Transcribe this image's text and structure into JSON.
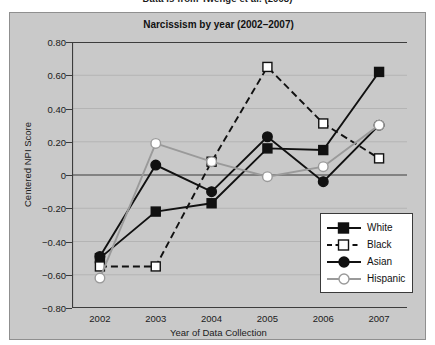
{
  "figure": {
    "caption": "Data is from Twenge et al. (2008)"
  },
  "chart_data": {
    "type": "line",
    "title": "Narcissism by year (2002–2007)",
    "xlabel": "Year of Data Collection",
    "ylabel": "Centered NPI Score",
    "x": [
      2002,
      2003,
      2004,
      2005,
      2006,
      2007
    ],
    "xtick_labels": [
      "2002",
      "2003",
      "2004",
      "2005",
      "2006",
      "2007"
    ],
    "ytick_labels": [
      "0.80",
      "0.60",
      "0.40",
      "0.20",
      "0",
      "−0.20",
      "−0.40",
      "−0.60",
      "−0.80"
    ],
    "ytick_values": [
      0.8,
      0.6,
      0.4,
      0.2,
      0,
      -0.2,
      -0.4,
      -0.6,
      -0.8
    ],
    "ylim": [
      -0.8,
      0.8
    ],
    "grid": true,
    "legend_position": "lower-right",
    "background_color": "#c9c9c9",
    "series": [
      {
        "name": "White",
        "values": [
          -0.5,
          -0.22,
          -0.17,
          0.16,
          0.15,
          0.62
        ],
        "marker": "filled-square",
        "line_style": "solid",
        "color": "#111111"
      },
      {
        "name": "Black",
        "values": [
          -0.55,
          -0.55,
          0.08,
          0.65,
          0.31,
          0.1
        ],
        "marker": "open-square",
        "line_style": "dashed",
        "color": "#111111"
      },
      {
        "name": "Asian",
        "values": [
          -0.49,
          0.06,
          -0.1,
          0.23,
          -0.04,
          0.3
        ],
        "marker": "filled-circle",
        "line_style": "solid",
        "color": "#111111"
      },
      {
        "name": "Hispanic",
        "values": [
          -0.62,
          0.19,
          0.08,
          -0.01,
          0.05,
          0.3
        ],
        "marker": "open-circle",
        "line_style": "solid",
        "color": "#9a9a9a"
      }
    ]
  }
}
